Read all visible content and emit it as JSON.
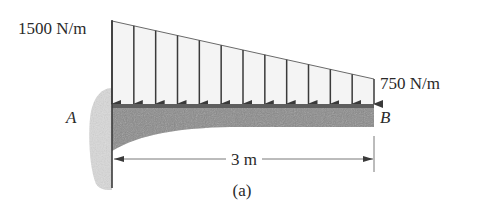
{
  "diagram": {
    "type": "cantilever-beam-trapezoidal-load",
    "load": {
      "left_intensity_label": "1500 N/m",
      "right_intensity_label": "750 N/m",
      "left_intensity": 1500,
      "right_intensity": 750,
      "unit": "N/m",
      "arrow_count": 13
    },
    "points": {
      "fixed_end_label": "A",
      "free_end_label": "B"
    },
    "dimension": {
      "length_label": "3 m",
      "length": 3,
      "unit": "m"
    },
    "caption": "(a)",
    "colors": {
      "line": "#3a3a3a",
      "beam_fill": "#8a8a8a",
      "beam_top_strip": "#5e5e5e",
      "wall_fill": "#d9d9d9",
      "load_fill": "#f4f4f4",
      "text": "#2a2a2a"
    }
  }
}
